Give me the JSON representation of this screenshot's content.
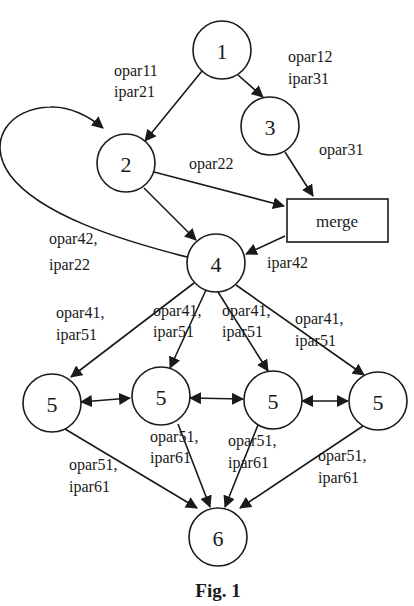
{
  "diagram": {
    "nodes": {
      "n1": {
        "label": "1"
      },
      "n2": {
        "label": "2"
      },
      "n3": {
        "label": "3"
      },
      "n4": {
        "label": "4"
      },
      "n5a": {
        "label": "5"
      },
      "n5b": {
        "label": "5"
      },
      "n5c": {
        "label": "5"
      },
      "n5d": {
        "label": "5"
      },
      "n6": {
        "label": "6"
      },
      "merge": {
        "label": "merge"
      }
    },
    "edge_labels": {
      "e12": [
        "opar11",
        "ipar21"
      ],
      "e13": [
        "opar12",
        "ipar31"
      ],
      "e3m": [
        "opar31"
      ],
      "e2m": [
        "opar22"
      ],
      "e42": [
        "opar42,",
        "ipar22"
      ],
      "em4": [
        "ipar42"
      ],
      "e45a": [
        "opar41,",
        "ipar51"
      ],
      "e45b": [
        "opar41,",
        "ipar51"
      ],
      "e45c": [
        "opar41,",
        "ipar51"
      ],
      "e45d": [
        "opar41,",
        "ipar51"
      ],
      "e5a6": [
        "opar51,",
        "ipar61"
      ],
      "e5b6": [
        "opar51,",
        "ipar61"
      ],
      "e5c6": [
        "opar51,",
        "ipar61"
      ],
      "e5d6": [
        "opar51,",
        "ipar61"
      ]
    },
    "edges": [
      {
        "from": "1",
        "to": "2"
      },
      {
        "from": "1",
        "to": "3"
      },
      {
        "from": "2",
        "to": "4"
      },
      {
        "from": "2",
        "to": "merge"
      },
      {
        "from": "3",
        "to": "merge"
      },
      {
        "from": "merge",
        "to": "4"
      },
      {
        "from": "4",
        "to": "2",
        "type": "loop"
      },
      {
        "from": "4",
        "to": "5a"
      },
      {
        "from": "4",
        "to": "5b"
      },
      {
        "from": "4",
        "to": "5c"
      },
      {
        "from": "4",
        "to": "5d"
      },
      {
        "from": "5a",
        "to": "5b",
        "type": "bidirectional"
      },
      {
        "from": "5b",
        "to": "5c",
        "type": "bidirectional"
      },
      {
        "from": "5c",
        "to": "5d",
        "type": "bidirectional"
      },
      {
        "from": "5a",
        "to": "6"
      },
      {
        "from": "5b",
        "to": "6"
      },
      {
        "from": "5c",
        "to": "6"
      },
      {
        "from": "5d",
        "to": "6"
      }
    ]
  },
  "caption": "Fig. 1"
}
